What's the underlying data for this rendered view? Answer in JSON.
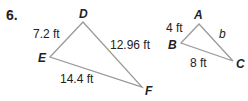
{
  "problem_number": "6.",
  "triangle_DEF": {
    "vertices": {
      "D": "D",
      "E": "E",
      "F": "F"
    },
    "sides": {
      "DE": "7.2 ft",
      "DF": "12.96 ft",
      "EF": "14.4 ft"
    }
  },
  "triangle_ABC": {
    "vertices": {
      "A": "A",
      "B": "B",
      "C": "C"
    },
    "sides": {
      "AB": "4 ft",
      "AC": "b",
      "BC": "8 ft"
    }
  },
  "colors": {
    "line": "#9a9a9a",
    "text": "#222222"
  }
}
